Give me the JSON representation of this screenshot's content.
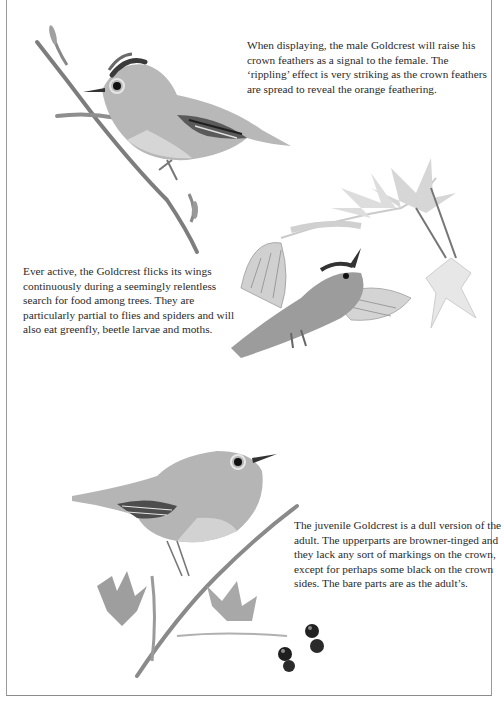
{
  "page": {
    "type": "field guide illustration page",
    "subject": "Goldcrest"
  },
  "captions": [
    {
      "id": "displaying",
      "lines": [
        "When displaying, the male Goldcrest will raise his",
        "crown feathers as a signal to the female. The",
        "‘rippling’ effect is very striking as the crown feathers",
        "are spread to reveal the orange feathering."
      ]
    },
    {
      "id": "feeding",
      "lines": [
        "Ever active, the Goldcrest flicks its wings",
        "continuously during a seemingly relentless",
        "search for food among trees. They are",
        "particularly partial to flies and spiders and will",
        "also eat greenfly, beetle larvae and moths."
      ]
    },
    {
      "id": "juvenile",
      "lines": [
        "The juvenile Goldcrest is a dull version of the",
        "adult. The upperparts are browner-tinged and",
        "they lack any sort of markings on the crown,",
        "except for perhaps some black on the crown",
        "sides. The bare parts are as the adult’s."
      ]
    }
  ],
  "illustrations": [
    {
      "id": "adult-displaying",
      "label": "Male Goldcrest perched on twig with raised crown"
    },
    {
      "id": "adult-fluttering",
      "label": "Goldcrest fluttering among sycamore leaves"
    },
    {
      "id": "juvenile-perched",
      "label": "Juvenile Goldcrest perched on hawthorn twig with berries"
    }
  ],
  "colors": {
    "text": "#2a2a2a",
    "border": "#9a9a9a",
    "ink_dark": "#1e1e1e",
    "ink_mid": "#7a7a7a",
    "ink_light": "#bdbdbd"
  }
}
